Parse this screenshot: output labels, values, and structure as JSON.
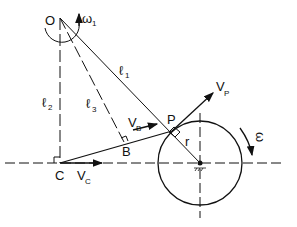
{
  "diagram": {
    "labels": {
      "O": "O",
      "omega1": "ω",
      "omega1_sub": "1",
      "l1": "ℓ",
      "l1_sub": "1",
      "l2": "ℓ",
      "l2_sub": "2",
      "l3": "ℓ",
      "l3_sub": "3",
      "VB": "V",
      "VB_sub": "B",
      "B": "B",
      "P": "P",
      "VP": "V",
      "VP_sub": "P",
      "r": "r",
      "omega": "ω",
      "C": "C",
      "VC": "V",
      "VC_sub": "C"
    },
    "colors": {
      "ink": "#111111",
      "background": "#ffffff"
    }
  }
}
